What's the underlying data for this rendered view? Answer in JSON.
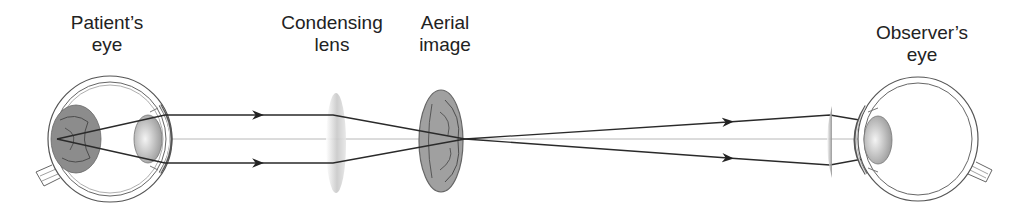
{
  "diagram": {
    "labels": {
      "patient_eye": [
        "Patient’s",
        "eye"
      ],
      "condensing_lens": [
        "Condensing",
        "lens"
      ],
      "aerial_image": [
        "Aerial",
        "image"
      ],
      "observer_eye": [
        "Observer’s",
        "eye"
      ]
    },
    "colors": {
      "line": "#2a2a2a",
      "outline": "#555555",
      "axis": "#b0b0b0",
      "retina_fill": "#8a8a8a",
      "aerial_fill": "#9a9a9a"
    }
  }
}
